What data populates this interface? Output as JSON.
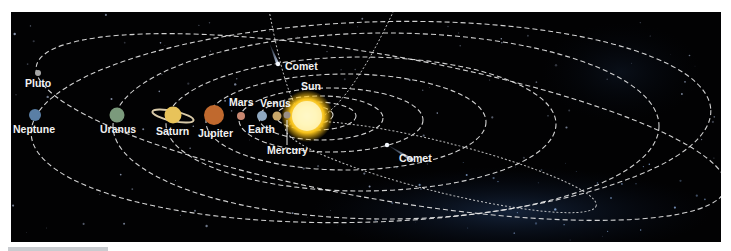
{
  "diagram": {
    "colors": {
      "background": "#020203",
      "orbit": "#e8e8e8",
      "label": "#f2f2f2",
      "sun_core": "#fffbe0",
      "sun_glow": "#f5b80a"
    },
    "sun": {
      "label": "Sun"
    },
    "planets": [
      {
        "name": "Mercury",
        "label": "Mercury",
        "color": "#9a8f85"
      },
      {
        "name": "Venus",
        "label": "Venus",
        "color": "#c9a76a"
      },
      {
        "name": "Earth",
        "label": "Earth",
        "color": "#8fa8c0"
      },
      {
        "name": "Mars",
        "label": "Mars",
        "color": "#c88770"
      },
      {
        "name": "Jupiter",
        "label": "Jupiter",
        "color": "#c0692e"
      },
      {
        "name": "Saturn",
        "label": "Saturn",
        "color": "#e8c35a"
      },
      {
        "name": "Uranus",
        "label": "Uranus",
        "color": "#7b9a7c"
      },
      {
        "name": "Neptune",
        "label": "Neptune",
        "color": "#5a7fa6"
      },
      {
        "name": "Pluto",
        "label": "Pluto",
        "color": "#a6a6a6"
      }
    ],
    "comets": [
      {
        "label": "Comet"
      },
      {
        "label": "Comet"
      }
    ]
  }
}
